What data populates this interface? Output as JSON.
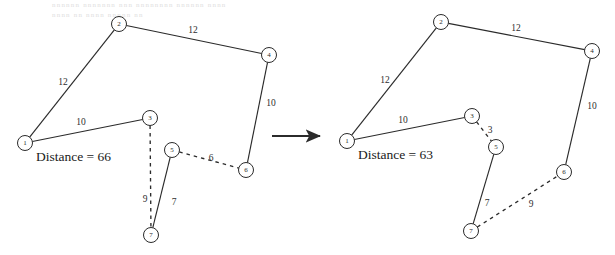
{
  "figure": {
    "background_color": "#ffffff",
    "stroke_color": "#2b2b2b",
    "transition_arrow": {
      "name": "transition-arrow",
      "x1": 272,
      "y1": 136,
      "x2": 326,
      "y2": 136
    },
    "ghost_artifacts": [
      {
        "text": "nnnnnn  nnnnnnn  nnn nnnnnnnn nnnnnn nnnn",
        "x": 52,
        "y": 7
      },
      {
        "text": "nnnn nn nnnn nnnnn nn",
        "x": 52,
        "y": 17
      }
    ],
    "panels": [
      {
        "id": "before",
        "name": "graph-panel-before",
        "caption": {
          "label": "Distance = 66",
          "x": 36,
          "y": 156
        },
        "nodes": [
          {
            "id": "1",
            "label": "1",
            "x": 25,
            "y": 143,
            "r": 7.5
          },
          {
            "id": "2",
            "label": "2",
            "x": 119,
            "y": 24,
            "r": 7.5
          },
          {
            "id": "3",
            "label": "3",
            "x": 150,
            "y": 118,
            "r": 7.5
          },
          {
            "id": "4",
            "label": "4",
            "x": 269,
            "y": 55,
            "r": 7.5
          },
          {
            "id": "5",
            "label": "5",
            "x": 172,
            "y": 150,
            "r": 7.5
          },
          {
            "id": "6",
            "label": "6",
            "x": 246,
            "y": 170,
            "r": 7.5
          },
          {
            "id": "7",
            "label": "7",
            "x": 151,
            "y": 235,
            "r": 7.5
          }
        ],
        "edges": [
          {
            "from": "1",
            "to": "2",
            "style": "solid",
            "weight": "12",
            "lx": 63,
            "ly": 82
          },
          {
            "from": "2",
            "to": "4",
            "style": "solid",
            "weight": "12",
            "lx": 193,
            "ly": 30
          },
          {
            "from": "4",
            "to": "6",
            "style": "solid",
            "weight": "10",
            "lx": 271,
            "ly": 103
          },
          {
            "from": "1",
            "to": "3",
            "style": "solid",
            "weight": "10",
            "lx": 81,
            "ly": 122
          },
          {
            "from": "3",
            "to": "7",
            "style": "dashed",
            "weight": "9",
            "lx": 145,
            "ly": 199
          },
          {
            "from": "7",
            "to": "5",
            "style": "solid",
            "weight": "7",
            "lx": 174,
            "ly": 202
          },
          {
            "from": "5",
            "to": "6",
            "style": "dashed",
            "weight": "6",
            "lx": 211,
            "ly": 158
          }
        ]
      },
      {
        "id": "after",
        "name": "graph-panel-after",
        "caption": {
          "label": "Distance = 63",
          "x": 358,
          "y": 154
        },
        "nodes": [
          {
            "id": "1",
            "label": "1",
            "x": 347,
            "y": 141,
            "r": 7.5
          },
          {
            "id": "2",
            "label": "2",
            "x": 441,
            "y": 22,
            "r": 7.5
          },
          {
            "id": "3",
            "label": "3",
            "x": 472,
            "y": 116,
            "r": 7.5
          },
          {
            "id": "4",
            "label": "4",
            "x": 592,
            "y": 51,
            "r": 7.5
          },
          {
            "id": "5",
            "label": "5",
            "x": 496,
            "y": 147,
            "r": 7.5
          },
          {
            "id": "6",
            "label": "6",
            "x": 564,
            "y": 172,
            "r": 7.5
          },
          {
            "id": "7",
            "label": "7",
            "x": 471,
            "y": 231,
            "r": 7.5
          }
        ],
        "edges": [
          {
            "from": "1",
            "to": "2",
            "style": "solid",
            "weight": "12",
            "lx": 385,
            "ly": 80
          },
          {
            "from": "2",
            "to": "4",
            "style": "solid",
            "weight": "12",
            "lx": 516,
            "ly": 28
          },
          {
            "from": "4",
            "to": "6",
            "style": "solid",
            "weight": "10",
            "lx": 592,
            "ly": 106
          },
          {
            "from": "1",
            "to": "3",
            "style": "solid",
            "weight": "10",
            "lx": 403,
            "ly": 120
          },
          {
            "from": "3",
            "to": "5",
            "style": "dashed",
            "weight": "3",
            "lx": 490,
            "ly": 130
          },
          {
            "from": "5",
            "to": "7",
            "style": "solid",
            "weight": "7",
            "lx": 487,
            "ly": 203
          },
          {
            "from": "7",
            "to": "6",
            "style": "dashed",
            "weight": "9",
            "lx": 531,
            "ly": 204
          }
        ]
      }
    ]
  }
}
